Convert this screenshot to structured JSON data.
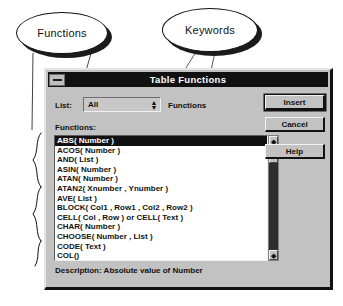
{
  "annotations": {
    "callouts": [
      {
        "id": "functions",
        "label": "Functions"
      },
      {
        "id": "keywords",
        "label": "Keywords"
      }
    ]
  },
  "dialog": {
    "title": "Table Functions",
    "sysmenu_icon": "system-menu-icon",
    "list_label": "List:",
    "combo": {
      "value": "All",
      "arrow_icon": "updown-arrow-icon"
    },
    "functions_word": "Functions",
    "functions_caption": "Functions:",
    "listbox": {
      "items": [
        {
          "text": "ABS( Number )",
          "selected": true
        },
        {
          "text": "ACOS( Number )",
          "selected": false
        },
        {
          "text": "AND( List )",
          "selected": false
        },
        {
          "text": "ASIN( Number )",
          "selected": false
        },
        {
          "text": "ATAN( Number )",
          "selected": false
        },
        {
          "text": "ATAN2( Xnumber , Ynumber )",
          "selected": false
        },
        {
          "text": "AVE( List )",
          "selected": false
        },
        {
          "text": "BLOCK( Col1 , Row1 , Col2 , Row2 )",
          "selected": false
        },
        {
          "text": "CELL( Col , Row ) or CELL( Text )",
          "selected": false
        },
        {
          "text": "CHAR( Number )",
          "selected": false
        },
        {
          "text": "CHOOSE( Number , List )",
          "selected": false
        },
        {
          "text": "CODE( Text )",
          "selected": false
        },
        {
          "text": "COL()",
          "selected": false
        }
      ]
    },
    "scrollbar": {
      "up_icon": "scroll-up-arrow-icon",
      "down_icon": "scroll-down-arrow-icon"
    },
    "description": "Description:  Absolute value of Number",
    "buttons": [
      {
        "id": "insert",
        "label": "Insert",
        "default": true
      },
      {
        "id": "cancel",
        "label": "Cancel",
        "default": false
      },
      {
        "id": "help",
        "label": "Help",
        "default": false
      }
    ]
  },
  "colors": {
    "dialog_face": "#c2c2c2",
    "titlebar": "#111111",
    "selection": "#111111",
    "listbox_bg": "#ffffff",
    "scroll_trough": "#2d2d2d"
  }
}
